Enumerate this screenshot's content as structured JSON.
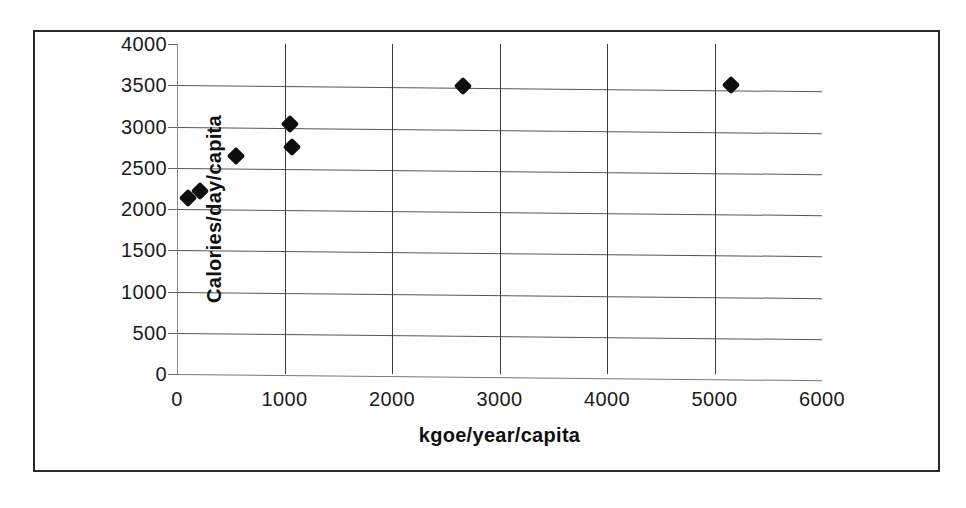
{
  "figure": {
    "border_color": "#2a2a2a",
    "background": "#ffffff"
  },
  "chart_data": {
    "type": "scatter",
    "title": "",
    "subtitle": "",
    "xlabel": "kgoe/year/capita",
    "ylabel": "Calories/day/capita",
    "xlim": [
      0,
      6000
    ],
    "ylim": [
      0,
      4000
    ],
    "x_ticks": [
      0,
      1000,
      2000,
      3000,
      4000,
      5000,
      6000
    ],
    "y_ticks": [
      0,
      500,
      1000,
      1500,
      2000,
      2500,
      3000,
      3500,
      4000
    ],
    "x_tick_labels": [
      "0",
      "1000",
      "2000",
      "3000",
      "4000",
      "5000",
      "6000"
    ],
    "y_tick_labels": [
      "0",
      "500",
      "1000",
      "1500",
      "2000",
      "2500",
      "3000",
      "3500",
      "4000"
    ],
    "grid": true,
    "grid_axes": "both",
    "legend": false,
    "legend_position": "none",
    "marker": "diamond",
    "marker_color": "#0d0d0d",
    "marker_size": 13,
    "series": [
      {
        "name": "Energy use vs calorie intake",
        "points": [
          {
            "x": 100,
            "y": 2130
          },
          {
            "x": 215,
            "y": 2220
          },
          {
            "x": 550,
            "y": 2640
          },
          {
            "x": 1050,
            "y": 3030
          },
          {
            "x": 1070,
            "y": 2750
          },
          {
            "x": 2660,
            "y": 3490
          },
          {
            "x": 5150,
            "y": 3500
          }
        ]
      }
    ]
  }
}
